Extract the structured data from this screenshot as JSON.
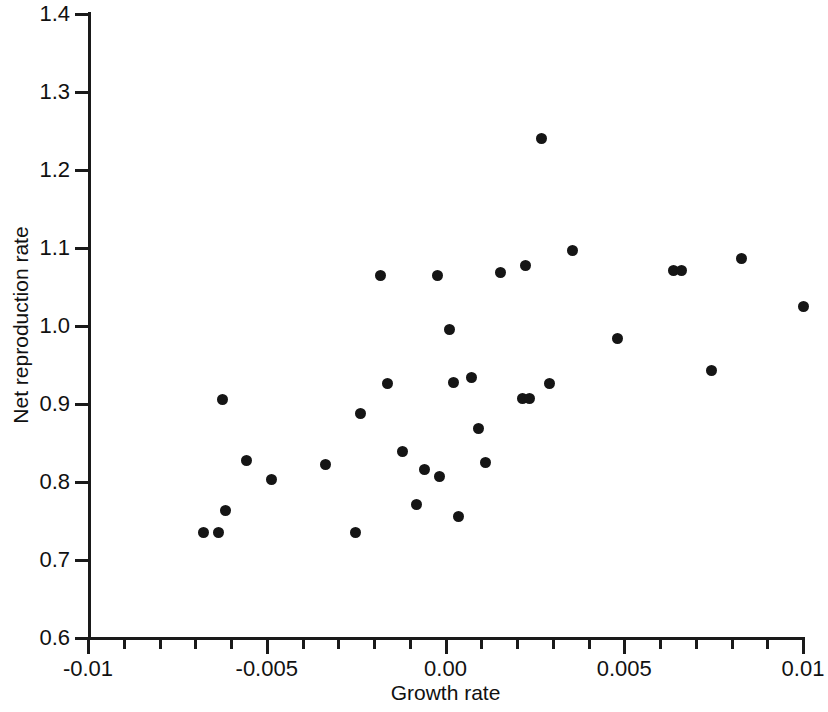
{
  "chart_data": {
    "type": "scatter",
    "title": "",
    "xlabel": "Growth rate",
    "ylabel": "Net reproduction rate",
    "xlim": [
      -0.01,
      0.01
    ],
    "ylim": [
      0.6,
      1.4
    ],
    "grid": false,
    "legend": null,
    "x_ticks": [
      {
        "value": -0.01,
        "label": "-0.01",
        "major": true
      },
      {
        "value": -0.009,
        "label": "",
        "major": false
      },
      {
        "value": -0.008,
        "label": "",
        "major": false
      },
      {
        "value": -0.007,
        "label": "",
        "major": false
      },
      {
        "value": -0.006,
        "label": "",
        "major": false
      },
      {
        "value": -0.005,
        "label": "-0.005",
        "major": true
      },
      {
        "value": -0.004,
        "label": "",
        "major": false
      },
      {
        "value": -0.003,
        "label": "",
        "major": false
      },
      {
        "value": -0.002,
        "label": "",
        "major": false
      },
      {
        "value": -0.001,
        "label": "",
        "major": false
      },
      {
        "value": 0.0,
        "label": "0.00",
        "major": true
      },
      {
        "value": 0.001,
        "label": "",
        "major": false
      },
      {
        "value": 0.002,
        "label": "",
        "major": false
      },
      {
        "value": 0.003,
        "label": "",
        "major": false
      },
      {
        "value": 0.004,
        "label": "",
        "major": false
      },
      {
        "value": 0.005,
        "label": "0.005",
        "major": true
      },
      {
        "value": 0.006,
        "label": "",
        "major": false
      },
      {
        "value": 0.007,
        "label": "",
        "major": false
      },
      {
        "value": 0.008,
        "label": "",
        "major": false
      },
      {
        "value": 0.009,
        "label": "",
        "major": false
      },
      {
        "value": 0.01,
        "label": "0.01",
        "major": true
      }
    ],
    "y_ticks": [
      {
        "value": 1.4,
        "label": "1.4"
      },
      {
        "value": 1.3,
        "label": "1.3"
      },
      {
        "value": 1.2,
        "label": "1.2"
      },
      {
        "value": 1.1,
        "label": "1.1"
      },
      {
        "value": 1.0,
        "label": "1.0"
      },
      {
        "value": 0.9,
        "label": "0.9"
      },
      {
        "value": 0.8,
        "label": "0.8"
      },
      {
        "value": 0.7,
        "label": "0.7"
      },
      {
        "value": 0.6,
        "label": "0.6"
      }
    ],
    "marker": {
      "shape": "circle",
      "color": "#151515",
      "size": 11
    },
    "points": [
      {
        "x": -0.00678,
        "y": 0.7355
      },
      {
        "x": -0.00634,
        "y": 0.7355
      },
      {
        "x": -0.00614,
        "y": 0.7637
      },
      {
        "x": -0.00625,
        "y": 0.9055
      },
      {
        "x": -0.00558,
        "y": 0.827
      },
      {
        "x": -0.00488,
        "y": 0.8032
      },
      {
        "x": -0.00337,
        "y": 0.8225
      },
      {
        "x": -0.00251,
        "y": 0.7355
      },
      {
        "x": -0.00237,
        "y": 0.888
      },
      {
        "x": -0.00181,
        "y": 1.0645
      },
      {
        "x": -0.00161,
        "y": 0.926
      },
      {
        "x": -0.0012,
        "y": 0.8385
      },
      {
        "x": -0.0008,
        "y": 0.7712
      },
      {
        "x": -0.0006,
        "y": 0.816
      },
      {
        "x": -0.00023,
        "y": 1.0645
      },
      {
        "x": -0.00016,
        "y": 0.807
      },
      {
        "x": 0.00012,
        "y": 0.9955
      },
      {
        "x": 0.00022,
        "y": 0.928
      },
      {
        "x": 0.00036,
        "y": 0.756
      },
      {
        "x": 0.00073,
        "y": 0.9345
      },
      {
        "x": 0.00091,
        "y": 0.868
      },
      {
        "x": 0.00112,
        "y": 0.825
      },
      {
        "x": 0.00155,
        "y": 1.068
      },
      {
        "x": 0.00215,
        "y": 0.9075
      },
      {
        "x": 0.00235,
        "y": 0.9065
      },
      {
        "x": 0.00224,
        "y": 1.078
      },
      {
        "x": 0.00268,
        "y": 1.24
      },
      {
        "x": 0.0029,
        "y": 0.926
      },
      {
        "x": 0.00354,
        "y": 1.097
      },
      {
        "x": 0.00482,
        "y": 0.984
      },
      {
        "x": 0.00638,
        "y": 1.0715
      },
      {
        "x": 0.0066,
        "y": 1.0715
      },
      {
        "x": 0.00744,
        "y": 0.943
      },
      {
        "x": 0.00828,
        "y": 1.086
      },
      {
        "x": 0.01,
        "y": 1.0255
      }
    ]
  },
  "axes_geometry": {
    "x_pixel_min": 88,
    "x_pixel_max": 803,
    "y_pixel_min": 14,
    "y_pixel_max": 638
  }
}
